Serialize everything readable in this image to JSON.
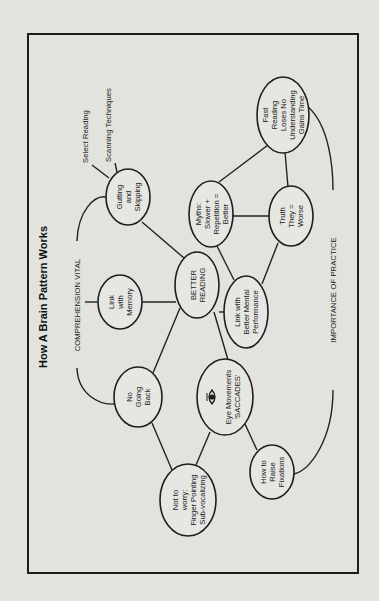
{
  "diagram": {
    "title": "How A Brain Pattern Works",
    "center": {
      "lines": [
        "BETTER",
        "READING"
      ]
    },
    "nodes": {
      "link_memory": [
        "Link",
        "with",
        "Memory"
      ],
      "gutting": [
        "Gutting",
        "and",
        "Skipping"
      ],
      "no_going_back": [
        "No",
        "Going",
        "Back"
      ],
      "eye_movements": [
        "Eye Movements",
        "'SACCADES'"
      ],
      "not_to_worry": [
        "Not to",
        "worry:",
        "Finger Pointing",
        "Sub-vocalizing"
      ],
      "raise_fixations": [
        "How to",
        "Raise",
        "Fixations"
      ],
      "mental_performance": [
        "Link with",
        "Better Mental",
        "Performance"
      ],
      "myths": [
        "Myths:",
        "Slower +",
        "Repetition =",
        "Better"
      ],
      "truth": [
        "Truth",
        "They =",
        "Worse"
      ],
      "fast_reading": [
        "Fast",
        "Reading",
        "Loses No",
        "Understanding",
        "Gains Time"
      ]
    },
    "branch_labels": {
      "comprehension": "COMPREHENSION VITAL",
      "practice": "IMPORTANCE OF PRACTICE",
      "select_reading": "Select Reading",
      "scanning": "Scanning Techniques"
    },
    "icons": {
      "eye": "eye-icon"
    },
    "colors": {
      "paper": "#e2e2de",
      "ink": "#1e1e1e"
    }
  }
}
